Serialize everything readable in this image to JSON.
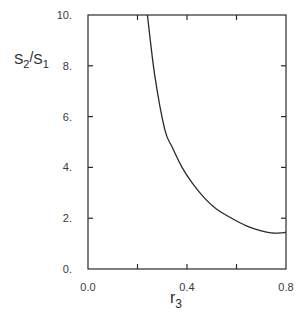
{
  "chart_data": {
    "type": "line",
    "title": "",
    "xlabel": "r",
    "xlabel_sub": "3",
    "ylabel_parts": {
      "a": "S",
      "a_sub": "2",
      "slash": "/",
      "b": "S",
      "b_sub": "1"
    },
    "ylabel": "S2/S1",
    "xlim": [
      0.0,
      0.8
    ],
    "ylim": [
      0.0,
      10.0
    ],
    "x_ticks": [
      0.0,
      0.2,
      0.4,
      0.6,
      0.8
    ],
    "x_tick_labels": [
      "0.0",
      "",
      "0.4",
      "",
      "0.8"
    ],
    "y_ticks": [
      0,
      2,
      4,
      6,
      8,
      10
    ],
    "y_tick_labels": [
      "0.",
      "2.",
      "4.",
      "6.",
      "8.",
      "10."
    ],
    "grid": false,
    "legend": null,
    "series": [
      {
        "name": "S2/S1 vs r3",
        "x": [
          0.24,
          0.27,
          0.31,
          0.34,
          0.38,
          0.42,
          0.47,
          0.52,
          0.58,
          0.64,
          0.7,
          0.74,
          0.78,
          0.8
        ],
        "y": [
          10.0,
          7.6,
          5.5,
          4.8,
          4.0,
          3.4,
          2.8,
          2.35,
          2.0,
          1.7,
          1.5,
          1.42,
          1.42,
          1.45
        ]
      }
    ]
  },
  "colors": {
    "line": "#2a2a2a",
    "axis": "#2a2a2a",
    "text": "#3a3a3a"
  }
}
